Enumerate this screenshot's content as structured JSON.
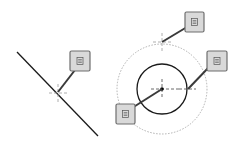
{
  "diagram": {
    "colors": {
      "stroke": "#1a1a1a",
      "tag_fill": "#d9d9d9",
      "tag_border": "#6e6e6e",
      "dotted": "#b0b0b0",
      "leader": "#3a3a3a"
    },
    "tags": [
      {
        "id": "line-point-tag",
        "icon": "note-icon"
      },
      {
        "id": "quadrant-top-tag",
        "icon": "note-icon"
      },
      {
        "id": "quadrant-right-tag",
        "icon": "note-icon"
      },
      {
        "id": "center-tag",
        "icon": "note-icon"
      }
    ]
  }
}
